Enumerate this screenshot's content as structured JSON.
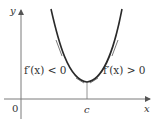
{
  "diagram": {
    "axes": {
      "x_label": "x",
      "y_label": "y",
      "origin_label": "0"
    },
    "critical_point_label": "c",
    "left_region_label": "f′(x) < 0",
    "right_region_label": "f′(x) > 0",
    "colors": {
      "curve": "#2a2a2a",
      "axis": "#7a7a7a",
      "text": "#333333"
    }
  }
}
